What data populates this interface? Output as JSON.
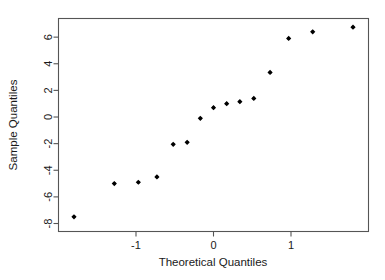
{
  "chart_data": {
    "type": "scatter",
    "title": "",
    "xlabel": "Theoretical Quantiles",
    "ylabel": "Sample Quantiles",
    "xlim": [
      -2.0,
      2.0
    ],
    "ylim": [
      -8.6,
      7.4
    ],
    "xticks": [
      -1,
      0,
      1
    ],
    "xticklabels": [
      "-1",
      "0",
      "1"
    ],
    "yticks": [
      6,
      4,
      2,
      0,
      -2,
      -4,
      -6,
      -8
    ],
    "yticklabels": [
      "6",
      "4",
      "2",
      "0",
      "-2",
      "-4",
      "-6",
      "-8"
    ],
    "grid": false,
    "legend": null,
    "marker": "diamond",
    "marker_color": "#000000",
    "series": [
      {
        "name": "Sample quantiles",
        "x": [
          -1.8,
          -1.28,
          -0.97,
          -0.73,
          -0.52,
          -0.34,
          -0.17,
          0.0,
          0.17,
          0.34,
          0.52,
          0.73,
          0.97,
          1.28,
          1.8
        ],
        "y": [
          -7.5,
          -5.0,
          -4.9,
          -4.5,
          -2.05,
          -1.9,
          -0.1,
          0.7,
          1.0,
          1.15,
          1.4,
          3.35,
          5.9,
          6.4,
          6.75
        ]
      }
    ]
  },
  "axes": {
    "x_title": "Theoretical Quantiles",
    "y_title": "Sample Quantiles"
  },
  "style": {
    "background": "#ffffff",
    "border_color": "#555555",
    "point_color": "#000000",
    "text_color": "#1a1a1a"
  }
}
